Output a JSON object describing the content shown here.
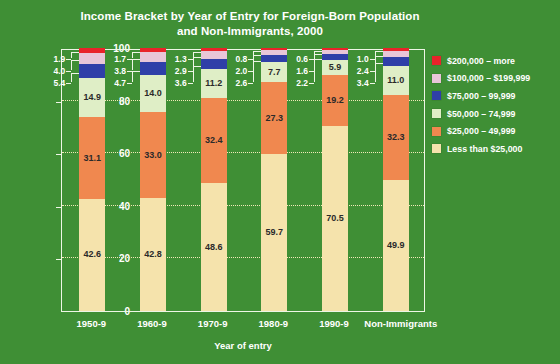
{
  "chart_data": {
    "type": "bar",
    "stacked": true,
    "title": "Income Bracket by Year of Entry for Foreign-Born Population and Non-Immigrants, 2000",
    "title_line1": "Income Bracket by Year of Entry for Foreign-Born Population",
    "title_line2": "and Non-Immigrants, 2000",
    "xlabel": "Year of entry",
    "ylabel": "Percent in income bracket, 2000",
    "ylim": [
      0,
      100
    ],
    "yticks": [
      0,
      20,
      40,
      60,
      80,
      100
    ],
    "ytick_labels": [
      "0",
      "20",
      "40",
      "60",
      "80",
      "100"
    ],
    "grid": true,
    "legend_position": "right",
    "categories": [
      "1950-9",
      "1960-9",
      "1970-9",
      "1980-9",
      "1990-9",
      "Non-Immigrants"
    ],
    "series": [
      {
        "name": "Less than $25,000",
        "color": "#f5e3ac",
        "values": [
          42.6,
          42.8,
          48.6,
          59.7,
          70.5,
          49.9
        ]
      },
      {
        "name": "$25,000 – 49,999",
        "color": "#f0884f",
        "values": [
          31.1,
          33.0,
          32.4,
          27.3,
          19.2,
          32.3
        ]
      },
      {
        "name": "$50,000 – 74,999",
        "color": "#dfeec6",
        "values": [
          14.9,
          14.0,
          11.2,
          7.7,
          5.9,
          11.0
        ]
      },
      {
        "name": "$75,000 – 99,999",
        "color": "#2f3fa8",
        "values": [
          5.4,
          4.7,
          3.6,
          2.6,
          2.2,
          3.4
        ]
      },
      {
        "name": "$100,000 – $199,999",
        "color": "#e8c6d8",
        "values": [
          4.0,
          3.8,
          2.9,
          2.0,
          1.6,
          2.4
        ]
      },
      {
        "name": "$200,000 – more",
        "color": "#e8242a",
        "values": [
          1.9,
          1.7,
          1.3,
          0.8,
          0.6,
          1.0
        ]
      }
    ],
    "legend_entries": [
      {
        "label": "$200,000 – more",
        "color": "#e8242a"
      },
      {
        "label": "$100,000 – $199,999",
        "color": "#e8c6d8"
      },
      {
        "label": "$75,000 – 99,999",
        "color": "#2f3fa8"
      },
      {
        "label": "$50,000 – 74,999",
        "color": "#dfeec6"
      },
      {
        "label": "$25,000 – 49,999",
        "color": "#f0884f"
      },
      {
        "label": "Less than $25,000",
        "color": "#f5e3ac"
      }
    ],
    "background_color": "#3f8f35",
    "text_color": "#ffffff",
    "gridline_color": "#f2e9b8"
  }
}
